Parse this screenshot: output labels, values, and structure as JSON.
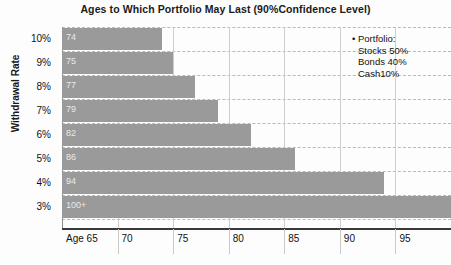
{
  "chart_data": {
    "type": "bar",
    "orientation": "horizontal",
    "title": "Ages to Which Portfolio May Last (90%Confidence Level)",
    "xlabel": "",
    "ylabel": "Withdrawal Rate",
    "categories": [
      "10%",
      "9%",
      "8%",
      "7%",
      "6%",
      "5%",
      "4%",
      "3%"
    ],
    "values": [
      74,
      75,
      77,
      79,
      82,
      86,
      94,
      100
    ],
    "bar_labels": [
      "74",
      "75",
      "77",
      "79",
      "82",
      "86",
      "94",
      "100+"
    ],
    "xlim": [
      65,
      100
    ],
    "xticks": [
      65,
      70,
      75,
      80,
      85,
      90,
      95,
      100
    ],
    "xtick_labels": [
      "Age 65",
      "70",
      "75",
      "80",
      "85",
      "90",
      "95",
      "100"
    ],
    "grid": "horizontal-dashed-and-vertical-solid",
    "legend_position": "top-right",
    "bar_color": "#9a9a9a",
    "gridline_color": "#b9b9b9",
    "axis_color": "#3a3a3a",
    "annotations": [
      "• Portfolio:",
      "Stocks 50%",
      "Bonds 40%",
      "Cash10%"
    ]
  },
  "legend": {
    "bullet": "•",
    "heading": "Portfolio:",
    "items": [
      "Stocks 50%",
      "Bonds 40%",
      "Cash10%"
    ]
  }
}
